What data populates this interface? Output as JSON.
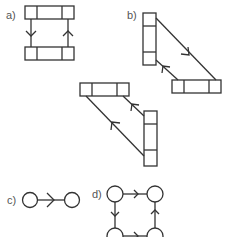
{
  "labels": {
    "a": "a)",
    "b": "b)",
    "c": "c)",
    "d": "d)"
  },
  "colors": {
    "stroke": "#333333",
    "label": "#555555",
    "background": "#ffffff"
  },
  "panels": [
    {
      "id": "a",
      "description": "Two horizontal three-cell boxes joined by two vertical edges; left edge arrow points down, right edge arrow points up"
    },
    {
      "id": "b",
      "description": "Vertical three-cell box and horizontal three-cell box joined by two diagonal edges with arrows; lower diagonal pair repeated with arrows pointing up-left"
    },
    {
      "id": "c",
      "description": "Two circles joined by an edge with a right-pointing arrow"
    },
    {
      "id": "d",
      "description": "Four circles in a square cycle with arrows: top right, right up, left down, bottom right"
    }
  ]
}
